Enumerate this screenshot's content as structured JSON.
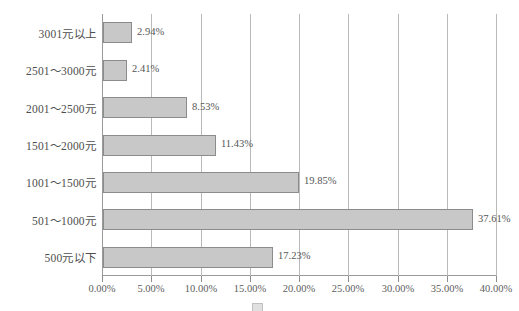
{
  "chart_data": {
    "type": "bar",
    "orientation": "horizontal",
    "title": "",
    "xlabel": "",
    "ylabel": "",
    "categories": [
      "3001元以上",
      "2501～3000元",
      "2001～2500元",
      "1501～2000元",
      "1001～1500元",
      "501～1000元",
      "500元以下"
    ],
    "values": [
      2.94,
      2.41,
      8.53,
      11.43,
      19.85,
      37.61,
      17.23
    ],
    "value_labels": [
      "2.94%",
      "2.41%",
      "8.53%",
      "11.43%",
      "19.85%",
      "37.61%",
      "17.23%"
    ],
    "xlim": [
      0,
      40
    ],
    "xtick_values": [
      0,
      5,
      10,
      15,
      20,
      25,
      30,
      35,
      40
    ],
    "xtick_labels": [
      "0.00%",
      "5.00%",
      "10.00%",
      "15.00%",
      "20.00%",
      "25.00%",
      "30.00%",
      "35.00%",
      "40.00%"
    ],
    "grid": "vertical",
    "legend": "none",
    "bar_fill_color": "#c8c8c8",
    "bar_border_color": "#8c8c8c",
    "gridline_color": "#b9b9b9",
    "axis_color": "#9a9a9a",
    "text_color": "#555555"
  },
  "caption": {
    "text": "",
    "note": "clipped"
  }
}
